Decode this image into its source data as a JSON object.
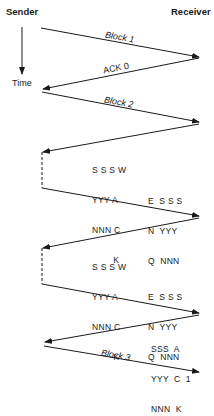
{
  "headers": {
    "sender": "Sender",
    "receiver": "Receiver"
  },
  "time_axis": {
    "label": "Time"
  },
  "messages": [
    {
      "label": "Block 1",
      "direction": "sender-to-receiver"
    },
    {
      "label": "ACK 0",
      "direction": "receiver-to-sender"
    },
    {
      "label": "Block 2",
      "direction": "sender-to-receiver"
    },
    {
      "label": "",
      "direction": "receiver-to-sender"
    },
    {
      "label": "",
      "direction": "sender-to-receiver"
    },
    {
      "label": "",
      "direction": "receiver-to-sender"
    },
    {
      "label": "",
      "direction": "sender-to-receiver"
    },
    {
      "label": "",
      "direction": "receiver-to-sender"
    },
    {
      "label": "Block 3",
      "direction": "sender-to-receiver"
    }
  ],
  "annotations": {
    "wack_1": [
      "S S S W",
      "YYY A",
      "NNN C",
      "        K"
    ],
    "enq_1": [
      "E  S S S",
      "N  YYY",
      "Q  NNN"
    ],
    "wack_2": [
      "S S S W",
      "YYY A",
      "NNN C",
      "        K"
    ],
    "enq_2": [
      "E  S S S",
      "N  YYY",
      "Q  NNN"
    ],
    "ack_1": [
      "SSS  A",
      "YYY  C  1",
      "NNN  K"
    ]
  },
  "colors": {
    "line": "#1a1a1a",
    "background": "#ffffff"
  }
}
